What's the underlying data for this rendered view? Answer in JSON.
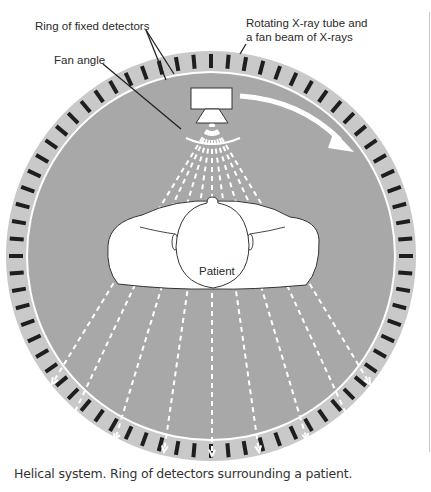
{
  "diagram": {
    "labels": {
      "detectors": "Ring of fixed detectors",
      "tube_line1": "Rotating X-ray tube and",
      "tube_line2": "a fan beam of X-rays",
      "fan_angle": "Fan angle",
      "patient": "Patient"
    },
    "caption": "Helical system. Ring of detectors surrounding a patient.",
    "colors": {
      "ring": "#c9c9c9",
      "detector": "#1e1e1e",
      "inner_disc": "#a8a8a8",
      "separator": "#ffffff",
      "patient_fill": "#ffffff",
      "outline": "#333333",
      "beam": "#ffffff"
    },
    "geometry": {
      "center": [
        211,
        256
      ],
      "outer_radius": 205,
      "inner_radius": 183,
      "detector_count": 72,
      "fan_rays": 9
    }
  }
}
